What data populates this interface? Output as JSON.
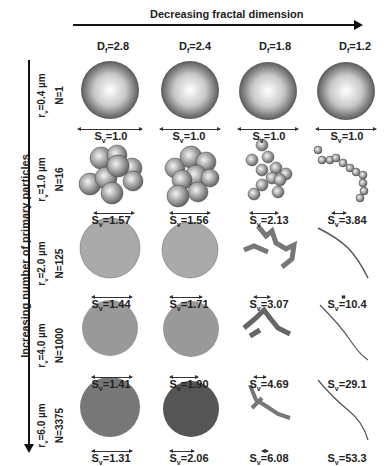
{
  "header": {
    "title": "Decreasing fractal dimension",
    "columns": [
      {
        "label": "D",
        "sub": "f",
        "value": "=2.8"
      },
      {
        "label": "D",
        "sub": "f",
        "value": "=2.4"
      },
      {
        "label": "D",
        "sub": "f",
        "value": "=1.8"
      },
      {
        "label": "D",
        "sub": "f",
        "value": "=1.2"
      }
    ]
  },
  "side": {
    "title": "Increasing number of primary particles",
    "rows": [
      {
        "r": "=0.4 µm",
        "n": "N=1"
      },
      {
        "r": "=1.0 µm",
        "n": "N=16"
      },
      {
        "r": "=2.0 µm",
        "n": "N=125"
      },
      {
        "r": "=4.0 µm",
        "n": "N=1000"
      },
      {
        "r": "=6.0 µm",
        "n": "N=3375"
      }
    ]
  },
  "grid": [
    [
      "=1.0",
      "=1.0",
      "=1.0",
      "=1.0"
    ],
    [
      "=1.57",
      "=1.56",
      "=2.13",
      "=3.84"
    ],
    [
      "=1.44",
      "=1.71",
      "=3.07",
      "=10.4"
    ],
    [
      "=1.41",
      "=1.90",
      "=4.69",
      "=29.1"
    ],
    [
      "=1.31",
      "=2.06",
      "=6.08",
      "=53.3"
    ]
  ],
  "sv_symbol": {
    "label": "S",
    "sub": "v"
  },
  "r_symbol": {
    "label": "r",
    "sub": "v"
  }
}
